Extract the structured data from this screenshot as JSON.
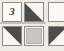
{
  "figure": {
    "name": "tile-grid",
    "background_color": "#efece4",
    "tile_face_color": "#fbfaf6",
    "tile_border_color": "#8d8d88",
    "shade_dark_color": "#4c4c4c",
    "shade_mid_color": "#c9c7c0",
    "width_px": 64,
    "height_px": 51,
    "columns": 3,
    "rows": 2
  },
  "tiles": [
    {
      "id": "tile-r1c1",
      "row": 1,
      "column": 1,
      "pattern": "digit",
      "label": "3",
      "x": 2,
      "y": 2,
      "w": 20,
      "h": 20
    },
    {
      "id": "tile-r1c2",
      "row": 1,
      "column": 2,
      "pattern": "triangle-lower-left",
      "label": "",
      "x": 24,
      "y": 2,
      "w": 20,
      "h": 20
    },
    {
      "id": "tile-r1c3",
      "row": 1,
      "column": 3,
      "pattern": "blank",
      "label": "",
      "x": 48,
      "y": 2,
      "w": 20,
      "h": 20
    },
    {
      "id": "tile-r2c1",
      "row": 2,
      "column": 1,
      "pattern": "triangle-upper-right",
      "label": "",
      "x": 2,
      "y": 26,
      "w": 20,
      "h": 20
    },
    {
      "id": "tile-r2c2",
      "row": 2,
      "column": 2,
      "pattern": "solid-fill",
      "label": "",
      "x": 24,
      "y": 26,
      "w": 20,
      "h": 20
    },
    {
      "id": "tile-r2c3",
      "row": 2,
      "column": 3,
      "pattern": "triangle-upper-left",
      "label": "",
      "x": 48,
      "y": 26,
      "w": 20,
      "h": 20
    }
  ],
  "separators": [
    {
      "id": "row-separator",
      "x": 0,
      "y": 22,
      "w": 46,
      "h": 2
    }
  ]
}
